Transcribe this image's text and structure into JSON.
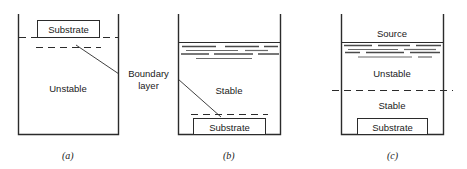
{
  "figure": {
    "domain_kind": "diagram",
    "background_color": "#ffffff",
    "line_color": "#2b2b2b",
    "text_color": "#1a1a1a",
    "callout": {
      "line1": "Boundary",
      "line2": "layer"
    },
    "panels": [
      {
        "id": "a",
        "label": "(a)",
        "substrate_label": "Substrate",
        "region_labels": [
          "Unstable"
        ],
        "substrate_position": "top"
      },
      {
        "id": "b",
        "label": "(b)",
        "substrate_label": "Substrate",
        "region_labels": [
          "Stable"
        ],
        "substrate_position": "bottom"
      },
      {
        "id": "c",
        "label": "(c)",
        "substrate_label": "Substrate",
        "source_label": "Source",
        "region_labels": [
          "Unstable",
          "Stable"
        ],
        "substrate_position": "bottom"
      }
    ]
  }
}
